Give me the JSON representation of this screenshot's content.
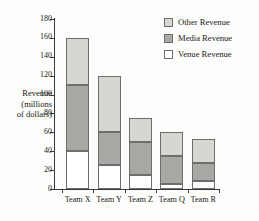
{
  "chart_data": {
    "type": "bar",
    "stacked": true,
    "title": "",
    "xlabel": "",
    "ylabel": "Revenue (millions of dollars)",
    "ylabel_lines": [
      "Revenue",
      "(millions",
      "of dollars)"
    ],
    "categories": [
      "Team X",
      "Team Y",
      "Team Z",
      "Team Q",
      "Team R"
    ],
    "series": [
      {
        "name": "Venue Revenue",
        "color": "#ffffff",
        "values": [
          40,
          25,
          15,
          5,
          8
        ]
      },
      {
        "name": "Media Revenue",
        "color": "#a8a8a5",
        "values": [
          70,
          35,
          35,
          30,
          20
        ]
      },
      {
        "name": "Other Revenue",
        "color": "#d6d6d3",
        "values": [
          50,
          60,
          25,
          25,
          25
        ]
      }
    ],
    "totals": [
      160,
      120,
      75,
      60,
      53
    ],
    "stack_order_bottom_to_top": [
      "Venue Revenue",
      "Media Revenue",
      "Other Revenue"
    ],
    "ylim": [
      0,
      180
    ],
    "ytick_step": 20,
    "yticks": [
      0,
      20,
      40,
      60,
      80,
      100,
      120,
      140,
      160,
      180
    ],
    "ytick_labels": [
      "0",
      "20",
      "40",
      "60",
      "80",
      "100",
      "120",
      "140",
      "160",
      "180"
    ],
    "grid": false,
    "legend_position": "top-right",
    "legend_entries": [
      {
        "label": "Other Revenue",
        "color": "#d6d6d3"
      },
      {
        "label": "Media Revenue",
        "color": "#a8a8a5"
      },
      {
        "label": "Venue Revenue",
        "color": "#ffffff"
      }
    ],
    "axis_color": "#3a3a3a",
    "bar_outline_color": "#6e6e6e",
    "background_color": "#fdfdfb"
  }
}
